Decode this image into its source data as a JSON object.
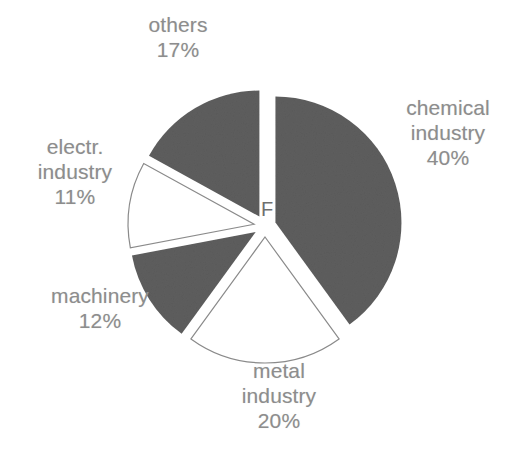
{
  "figure": {
    "center_marker": "F",
    "background_color": "#ffffff",
    "label_color": "#8d8d8d",
    "filled_slice_color": "#5e5e5e",
    "outline_slice_color": "#ffffff",
    "outline_stroke_color": "#8a8a8a"
  },
  "chart_data": {
    "type": "pie",
    "title": "",
    "subtitle": "",
    "xlabel": "",
    "ylabel": "",
    "legend_position": "none",
    "grid": false,
    "center_annotation": "F",
    "units": "percent",
    "total": 100,
    "categories": [
      "chemical industry",
      "metal industry",
      "machinery",
      "electr. industry",
      "others"
    ],
    "values": [
      40,
      20,
      12,
      11,
      17
    ],
    "slices": [
      {
        "name": "chemical industry",
        "label": "chemical\nindustry\n40%",
        "value": 40,
        "percent": "40%",
        "fill": "#5e5e5e",
        "style": "filled",
        "exploded": true,
        "start_angle_deg": 0,
        "end_angle_deg": 144
      },
      {
        "name": "metal industry",
        "label": "metal\nindustry\n20%",
        "value": 20,
        "percent": "20%",
        "fill": "#ffffff",
        "style": "outlined",
        "exploded": true,
        "start_angle_deg": 144,
        "end_angle_deg": 216
      },
      {
        "name": "machinery",
        "label": "machinery\n12%",
        "value": 12,
        "percent": "12%",
        "fill": "#5e5e5e",
        "style": "filled",
        "exploded": true,
        "start_angle_deg": 216,
        "end_angle_deg": 259.2
      },
      {
        "name": "electr. industry",
        "label": "electr.\nindustry\n11%",
        "value": 11,
        "percent": "11%",
        "fill": "#ffffff",
        "style": "outlined",
        "exploded": true,
        "start_angle_deg": 259.2,
        "end_angle_deg": 298.8
      },
      {
        "name": "others",
        "label": "others\n17%",
        "value": 17,
        "percent": "17%",
        "fill": "#5e5e5e",
        "style": "filled",
        "exploded": true,
        "start_angle_deg": 298.8,
        "end_angle_deg": 360
      }
    ]
  }
}
